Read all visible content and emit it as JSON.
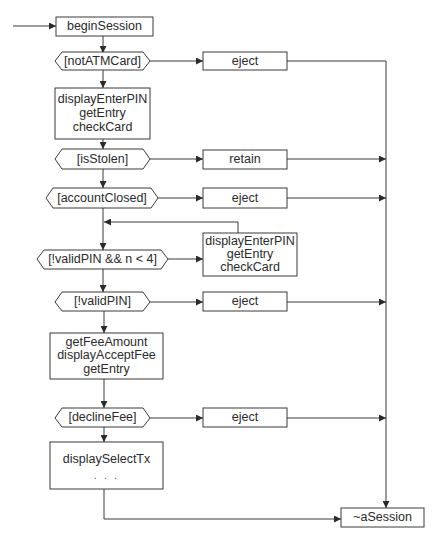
{
  "diagram": {
    "type": "activity-diagram",
    "nodes": {
      "begin_session": {
        "label": "beginSession"
      },
      "not_atm_card": {
        "label": "[notATMCard]"
      },
      "eject_1": {
        "label": "eject"
      },
      "enter_pin_1": {
        "lines": [
          "displayEnterPIN",
          "getEntry",
          "checkCard"
        ]
      },
      "is_stolen": {
        "label": "[isStolen]"
      },
      "retain": {
        "label": "retain"
      },
      "account_closed": {
        "label": "[accountClosed]"
      },
      "eject_2": {
        "label": "eject"
      },
      "invalid_pin_retry": {
        "label": "[!validPIN && n < 4]"
      },
      "enter_pin_2": {
        "lines": [
          "displayEnterPIN",
          "getEntry",
          "checkCard"
        ]
      },
      "invalid_pin": {
        "label": "[!validPIN]"
      },
      "eject_3": {
        "label": "eject"
      },
      "fee": {
        "lines": [
          "getFeeAmount",
          "displayAcceptFee",
          "getEntry"
        ]
      },
      "decline_fee": {
        "label": "[declineFee]"
      },
      "eject_4": {
        "label": "eject"
      },
      "select_tx": {
        "lines": [
          "displaySelectTx",
          ". . ."
        ]
      },
      "end_session": {
        "label": "~aSession"
      }
    },
    "edges": [
      [
        "start",
        "begin_session"
      ],
      [
        "begin_session",
        "not_atm_card"
      ],
      [
        "not_atm_card",
        "eject_1"
      ],
      [
        "eject_1",
        "end_session"
      ],
      [
        "not_atm_card",
        "enter_pin_1"
      ],
      [
        "enter_pin_1",
        "is_stolen"
      ],
      [
        "is_stolen",
        "retain"
      ],
      [
        "retain",
        "end_session"
      ],
      [
        "is_stolen",
        "account_closed"
      ],
      [
        "account_closed",
        "eject_2"
      ],
      [
        "eject_2",
        "end_session"
      ],
      [
        "account_closed",
        "invalid_pin_retry"
      ],
      [
        "invalid_pin_retry",
        "enter_pin_2"
      ],
      [
        "enter_pin_2",
        "invalid_pin_retry"
      ],
      [
        "invalid_pin_retry",
        "invalid_pin"
      ],
      [
        "invalid_pin",
        "eject_3"
      ],
      [
        "eject_3",
        "end_session"
      ],
      [
        "invalid_pin",
        "fee"
      ],
      [
        "fee",
        "decline_fee"
      ],
      [
        "decline_fee",
        "eject_4"
      ],
      [
        "eject_4",
        "end_session"
      ],
      [
        "decline_fee",
        "select_tx"
      ],
      [
        "select_tx",
        "end_session"
      ]
    ]
  }
}
